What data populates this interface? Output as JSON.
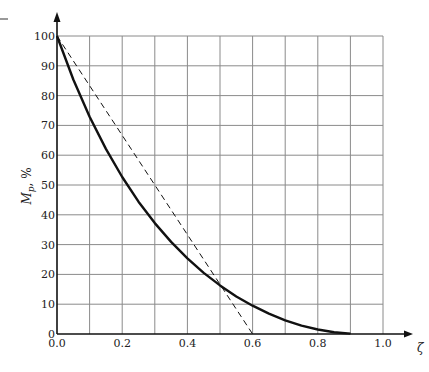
{
  "chart_data": {
    "type": "line",
    "title": "",
    "xlabel": "ζ",
    "ylabel": "M_p, %",
    "xlim": [
      0.0,
      1.0
    ],
    "ylim": [
      0,
      100
    ],
    "grid": true,
    "x_ticks": [
      0.0,
      0.1,
      0.2,
      0.3,
      0.4,
      0.5,
      0.6,
      0.7,
      0.8,
      0.9,
      1.0
    ],
    "x_tick_labels": [
      "0.0",
      "0.2",
      "0.4",
      "0.6",
      "0.8",
      "1.0"
    ],
    "y_ticks": [
      0,
      10,
      20,
      30,
      40,
      50,
      60,
      70,
      80,
      90,
      100
    ],
    "y_tick_labels": [
      "0",
      "10",
      "20",
      "30",
      "40",
      "50",
      "60",
      "70",
      "80",
      "90",
      "100"
    ],
    "legend": null,
    "series": [
      {
        "name": "Percent overshoot (exact)",
        "style": "solid",
        "x": [
          0.0,
          0.05,
          0.1,
          0.15,
          0.2,
          0.25,
          0.3,
          0.35,
          0.4,
          0.45,
          0.5,
          0.55,
          0.6,
          0.65,
          0.7,
          0.75,
          0.8,
          0.85,
          0.9
        ],
        "values": [
          100,
          85.4,
          72.9,
          62.1,
          52.7,
          44.4,
          37.2,
          30.9,
          25.4,
          20.5,
          16.3,
          12.6,
          9.5,
          6.8,
          4.6,
          2.8,
          1.5,
          0.6,
          0.15
        ]
      },
      {
        "name": "Linear approximation",
        "style": "dashed",
        "x": [
          0.0,
          0.6
        ],
        "values": [
          100,
          0
        ]
      }
    ]
  },
  "labels": {
    "x_axis": "ζ",
    "y_axis_main": "M",
    "y_axis_sub": "p",
    "y_axis_suffix": ", %"
  },
  "colors": {
    "curve": "#111111",
    "grid": "#8a8a8a",
    "axis": "#111111"
  }
}
